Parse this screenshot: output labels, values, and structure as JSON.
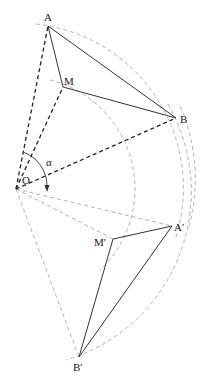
{
  "diagram": {
    "center": {
      "label": "O",
      "x": 16,
      "y": 189
    },
    "angle_label": "α",
    "points": {
      "A": {
        "label": "A",
        "x": 48,
        "y": 26
      },
      "M": {
        "label": "M",
        "x": 63,
        "y": 87
      },
      "B": {
        "label": "B",
        "x": 176,
        "y": 118
      },
      "A2": {
        "label": "A'",
        "x": 172,
        "y": 226
      },
      "M2": {
        "label": "M'",
        "x": 113,
        "y": 239
      },
      "B2": {
        "label": "B'",
        "x": 79,
        "y": 357
      }
    },
    "colors": {
      "solid": "#333333",
      "dark_dash": "#222222",
      "light_dash": "#aaaaaa"
    }
  }
}
